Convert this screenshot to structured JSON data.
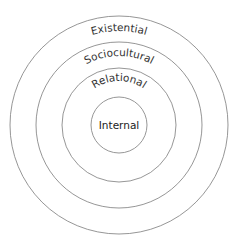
{
  "diagram": {
    "type": "concentric-circles",
    "layers": [
      {
        "label": "Existential",
        "position": "outermost"
      },
      {
        "label": "Sociocultural",
        "position": "second"
      },
      {
        "label": "Relational",
        "position": "third"
      },
      {
        "label": "Internal",
        "position": "center"
      }
    ],
    "colors": {
      "stroke": "#8a8a8a",
      "text": "#333333",
      "background": "#ffffff"
    }
  }
}
